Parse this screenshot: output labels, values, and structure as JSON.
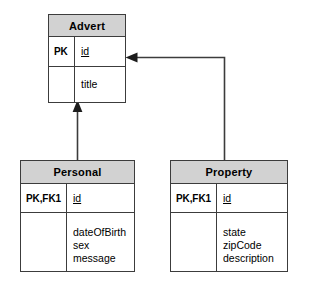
{
  "diagram": {
    "type": "erd-class-diagram",
    "colors": {
      "header_fill": "#d2d2d2",
      "box_fill": "#ffffff",
      "line": "#3c3c3c",
      "text": "#000000"
    }
  },
  "entities": {
    "advert": {
      "name": "Advert",
      "key_label": "PK",
      "pk_attribute": "id",
      "attributes": [
        "title"
      ]
    },
    "personal": {
      "name": "Personal",
      "key_label": "PK,FK1",
      "pk_attribute": "id",
      "attributes": [
        "dateOfBirth",
        "sex",
        "message"
      ]
    },
    "property": {
      "name": "Property",
      "key_label": "PK,FK1",
      "pk_attribute": "id",
      "attributes": [
        "state",
        "zipCode",
        "description"
      ]
    }
  },
  "relationships": [
    {
      "id": "personal-to-advert",
      "from": "Personal",
      "to": "Advert",
      "arrow": "up-arrowhead",
      "style": "solid"
    },
    {
      "id": "property-to-advert",
      "from": "Property",
      "to": "Advert",
      "arrow": "left-arrowhead",
      "style": "solid"
    }
  ]
}
